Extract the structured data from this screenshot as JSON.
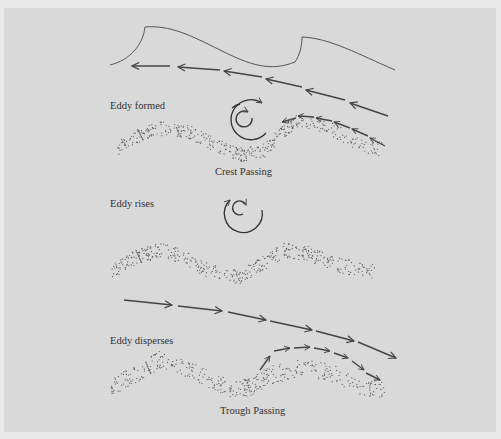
{
  "diagram": {
    "labels": {
      "eddy_formed": "Eddy formed",
      "crest_passing": "Crest Passing",
      "eddy_rises": "Eddy rises",
      "eddy_disperses": "Eddy disperses",
      "trough_passing": "Trough Passing"
    },
    "stages": [
      {
        "name": "Eddy formed",
        "caption": "Crest Passing"
      },
      {
        "name": "Eddy rises",
        "caption": ""
      },
      {
        "name": "Eddy disperses",
        "caption": "Trough Passing"
      }
    ],
    "colors": {
      "background": "#d9d9d9",
      "frame": "#e9e9e9",
      "line": "#444444",
      "sediment": "#555555"
    }
  }
}
